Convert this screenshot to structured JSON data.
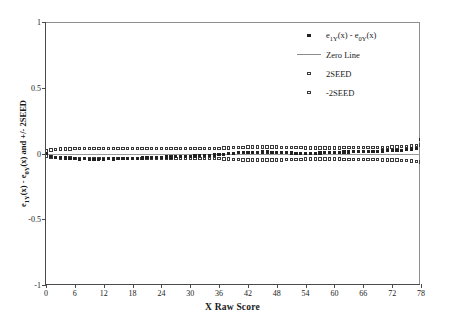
{
  "chart_data": {
    "type": "scatter",
    "title": "",
    "xlabel": "X Raw Score",
    "ylabel": "e<sub>1Y</sub>(x) - e<sub>0Y</sub>(x) and +/- 2SEED",
    "ylabel_plain": "e1Y(x) - e0Y(x) and +/- 2SEED",
    "xlim": [
      0,
      78
    ],
    "ylim": [
      -1,
      1
    ],
    "xticks": [
      0,
      6,
      12,
      18,
      24,
      30,
      36,
      42,
      48,
      54,
      60,
      66,
      72,
      78
    ],
    "xtick_labels": [
      "0",
      "6",
      "12",
      "18",
      "24",
      "30",
      "36",
      "42",
      "48",
      "54",
      "60",
      "66",
      "72",
      "78"
    ],
    "yticks": [
      1,
      0.5,
      0,
      -0.5,
      -1
    ],
    "ytick_labels": [
      "1",
      "0.5",
      "0",
      "-0.5",
      "-1"
    ],
    "grid": false,
    "legend_position": "top-right",
    "zero_line_value": 0,
    "x": [
      0,
      1,
      2,
      3,
      4,
      5,
      6,
      7,
      8,
      9,
      10,
      11,
      12,
      13,
      14,
      15,
      16,
      17,
      18,
      19,
      20,
      21,
      22,
      23,
      24,
      25,
      26,
      27,
      28,
      29,
      30,
      31,
      32,
      33,
      34,
      35,
      36,
      37,
      38,
      39,
      40,
      41,
      42,
      43,
      44,
      45,
      46,
      47,
      48,
      49,
      50,
      51,
      52,
      53,
      54,
      55,
      56,
      57,
      58,
      59,
      60,
      61,
      62,
      63,
      64,
      65,
      66,
      67,
      68,
      69,
      70,
      71,
      72,
      73,
      74,
      75,
      76,
      77,
      78
    ],
    "series": [
      {
        "name": "e1Y(x) - e0Y(x)",
        "label": "e<sub>1Y</sub>(x) - e<sub>0Y</sub>(x)",
        "marker": "filled-square",
        "values": [
          0.0,
          -0.022,
          -0.03,
          -0.029,
          -0.034,
          -0.036,
          -0.041,
          -0.044,
          -0.04,
          -0.043,
          -0.046,
          -0.045,
          -0.043,
          -0.04,
          -0.042,
          -0.039,
          -0.041,
          -0.038,
          -0.036,
          -0.037,
          -0.034,
          -0.033,
          -0.031,
          -0.03,
          -0.029,
          -0.027,
          -0.026,
          -0.025,
          -0.023,
          -0.022,
          -0.02,
          -0.019,
          -0.018,
          -0.016,
          -0.014,
          -0.012,
          -0.01,
          -0.006,
          -0.002,
          0.002,
          0.005,
          0.006,
          0.008,
          0.009,
          0.01,
          0.011,
          0.011,
          0.01,
          0.009,
          0.008,
          0.006,
          0.004,
          0.003,
          0.002,
          0.001,
          0.002,
          0.003,
          0.004,
          0.005,
          0.006,
          0.008,
          0.009,
          0.011,
          0.012,
          0.013,
          0.014,
          0.015,
          0.016,
          0.017,
          0.018,
          0.019,
          0.02,
          0.021,
          0.022,
          0.023,
          0.028,
          0.034,
          0.036,
          0.104
        ]
      },
      {
        "name": "2SEED",
        "label": "2SEED",
        "marker": "open-square",
        "values": [
          0.018,
          0.028,
          0.031,
          0.033,
          0.034,
          0.035,
          0.036,
          0.036,
          0.037,
          0.037,
          0.038,
          0.038,
          0.038,
          0.038,
          0.038,
          0.038,
          0.038,
          0.038,
          0.038,
          0.038,
          0.038,
          0.038,
          0.038,
          0.038,
          0.038,
          0.038,
          0.038,
          0.038,
          0.038,
          0.038,
          0.038,
          0.038,
          0.038,
          0.038,
          0.038,
          0.039,
          0.04,
          0.041,
          0.043,
          0.045,
          0.047,
          0.048,
          0.049,
          0.05,
          0.05,
          0.05,
          0.05,
          0.05,
          0.049,
          0.048,
          0.047,
          0.046,
          0.045,
          0.044,
          0.043,
          0.043,
          0.043,
          0.043,
          0.043,
          0.043,
          0.043,
          0.043,
          0.044,
          0.044,
          0.045,
          0.045,
          0.046,
          0.046,
          0.047,
          0.047,
          0.048,
          0.048,
          0.049,
          0.05,
          0.052,
          0.054,
          0.057,
          0.06,
          0.064
        ]
      },
      {
        "name": "-2SEED",
        "label": "-2SEED",
        "marker": "open-square",
        "values": [
          -0.018,
          -0.028,
          -0.031,
          -0.033,
          -0.034,
          -0.035,
          -0.036,
          -0.036,
          -0.037,
          -0.037,
          -0.038,
          -0.038,
          -0.038,
          -0.038,
          -0.038,
          -0.038,
          -0.038,
          -0.038,
          -0.038,
          -0.038,
          -0.038,
          -0.038,
          -0.038,
          -0.038,
          -0.038,
          -0.038,
          -0.038,
          -0.038,
          -0.038,
          -0.038,
          -0.038,
          -0.038,
          -0.038,
          -0.038,
          -0.038,
          -0.039,
          -0.04,
          -0.041,
          -0.043,
          -0.045,
          -0.047,
          -0.048,
          -0.049,
          -0.05,
          -0.05,
          -0.05,
          -0.05,
          -0.05,
          -0.049,
          -0.048,
          -0.047,
          -0.046,
          -0.045,
          -0.044,
          -0.043,
          -0.043,
          -0.043,
          -0.043,
          -0.043,
          -0.043,
          -0.043,
          -0.043,
          -0.044,
          -0.044,
          -0.045,
          -0.045,
          -0.046,
          -0.046,
          -0.047,
          -0.047,
          -0.048,
          -0.048,
          -0.049,
          -0.05,
          -0.052,
          -0.054,
          -0.057,
          -0.06,
          -0.064
        ]
      }
    ],
    "legend": [
      {
        "label": "e<sub>1Y</sub>(x) - e<sub>0Y</sub>(x)",
        "key": "filled-square"
      },
      {
        "label": "Zero Line",
        "key": "line"
      },
      {
        "label": "2SEED",
        "key": "open-square"
      },
      {
        "label": "-2SEED",
        "key": "open-square"
      }
    ]
  },
  "colors": {
    "marker": "#222222",
    "band_outline": "#3a3a3a",
    "zero_line": "#9a9a9a",
    "axis": "#4a4a4a",
    "frame": "#8e8e8e",
    "text": "#1a1a1a",
    "background": "#ffffff"
  }
}
